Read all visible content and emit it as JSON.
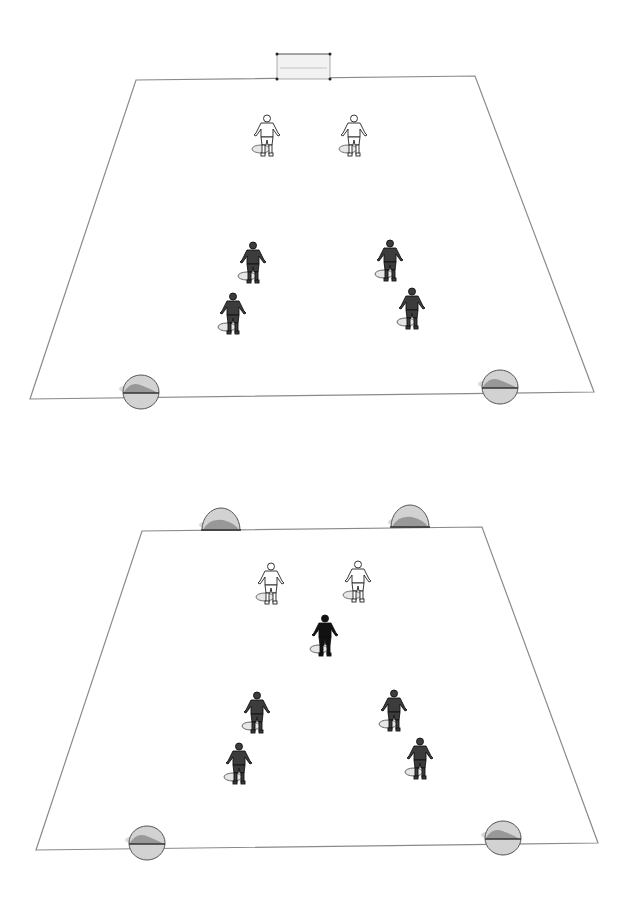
{
  "colors": {
    "background": "#ffffff",
    "field_line": "#8a8a8a",
    "player_white_fill": "#ffffff",
    "player_white_stroke": "#222222",
    "player_dark_fill": "#3c3c3c",
    "player_black_fill": "#111111",
    "cone_fill": "#d2d2d2",
    "cone_shade": "#8e8e8e",
    "cone_stroke": "#555555",
    "shadow": "#cfcfcf",
    "goal_net": "#f2f2f2"
  },
  "diagrams": [
    {
      "name": "drill-1",
      "field_corners": [
        [
          136,
          80
        ],
        [
          475,
          76
        ],
        [
          594,
          392
        ],
        [
          30,
          399
        ]
      ],
      "goal": {
        "x1": 277,
        "x2": 330,
        "top": 54,
        "bottom": 79
      },
      "players": [
        {
          "team": "white",
          "x": 267,
          "y": 115
        },
        {
          "team": "white",
          "x": 354,
          "y": 115
        },
        {
          "team": "dark",
          "x": 253,
          "y": 242
        },
        {
          "team": "dark",
          "x": 390,
          "y": 240
        },
        {
          "team": "dark",
          "x": 233,
          "y": 293
        },
        {
          "team": "dark",
          "x": 412,
          "y": 288
        }
      ],
      "cones": [
        {
          "x": 141,
          "y": 394
        },
        {
          "x": 500,
          "y": 389
        }
      ]
    },
    {
      "name": "drill-2",
      "field_corners": [
        [
          142,
          531
        ],
        [
          482,
          527
        ],
        [
          598,
          843
        ],
        [
          36,
          850
        ]
      ],
      "players": [
        {
          "team": "white",
          "x": 271,
          "y": 563
        },
        {
          "team": "white",
          "x": 358,
          "y": 561
        },
        {
          "team": "black",
          "x": 325,
          "y": 615
        },
        {
          "team": "dark",
          "x": 257,
          "y": 692
        },
        {
          "team": "dark",
          "x": 394,
          "y": 690
        },
        {
          "team": "dark",
          "x": 239,
          "y": 743
        },
        {
          "team": "dark",
          "x": 420,
          "y": 738
        }
      ],
      "cones_top": [
        {
          "x": 221,
          "y": 530
        },
        {
          "x": 410,
          "y": 527
        }
      ],
      "cones": [
        {
          "x": 147,
          "y": 845
        },
        {
          "x": 503,
          "y": 840
        }
      ]
    }
  ]
}
